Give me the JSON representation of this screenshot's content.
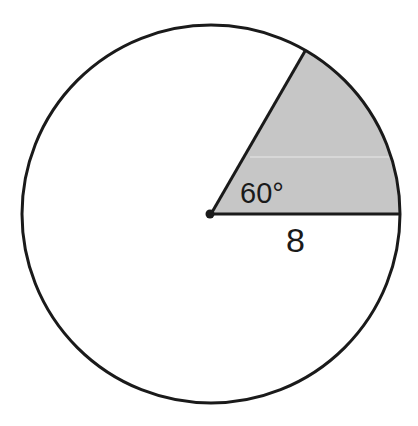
{
  "diagram": {
    "type": "circle-sector",
    "circle": {
      "center_label": "center point"
    },
    "sector": {
      "angle_label": "60°",
      "radius_label": "8",
      "angle_degrees": 60,
      "radius_value": 8
    },
    "colors": {
      "stroke": "#1a1a1a",
      "sector_fill": "#c6c6c6",
      "background": "#ffffff"
    }
  }
}
